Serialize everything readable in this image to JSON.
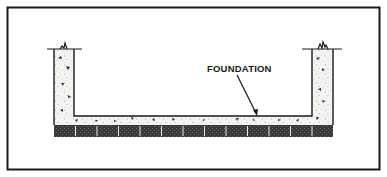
{
  "diagram": {
    "type": "cross-section",
    "labels": {
      "foundation": "FOUNDATION"
    },
    "colors": {
      "ink": "#1a1a1a",
      "paper": "#ffffff",
      "concrete": "#f4f4f2",
      "block": "#3a3a3a"
    },
    "block_count": 13
  }
}
